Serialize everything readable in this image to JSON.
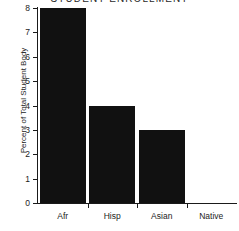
{
  "chart_data": {
    "type": "bar",
    "title": "STUDENT ENROLLMENT",
    "xlabel": "",
    "ylabel": "Percent of Total Student Body",
    "categories": [
      "Afr",
      "Hisp",
      "Asian",
      "Native"
    ],
    "values": [
      8,
      4,
      3,
      0
    ],
    "ylim": [
      0,
      8
    ],
    "yticks": [
      "0",
      "1",
      "2",
      "3",
      "4",
      "5",
      "6",
      "7",
      "8"
    ],
    "grid": false,
    "legend": "none",
    "bar_color": "#111111",
    "axis_color": "#1a1a1a",
    "text_color": "#1c1c1c"
  }
}
